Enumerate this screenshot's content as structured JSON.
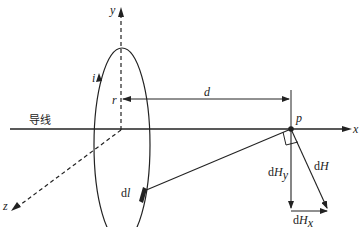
{
  "diagram": {
    "type": "physics-magnetic-field",
    "labels": {
      "y_axis": "y",
      "x_axis": "x",
      "z_axis": "z",
      "current": "i",
      "radius": "r",
      "distance": "d",
      "wire": "导线",
      "point": "p",
      "element": "dl",
      "element_d": "d",
      "element_l": "l",
      "dH": "dH",
      "dH_d": "d",
      "dH_H": "H",
      "dHy_d": "d",
      "dHy_H": "H",
      "dHy_sub": "y",
      "dHx_d": "d",
      "dHx_H": "H",
      "dHx_sub": "x"
    },
    "colors": {
      "stroke": "#222222",
      "background": "#ffffff"
    }
  }
}
